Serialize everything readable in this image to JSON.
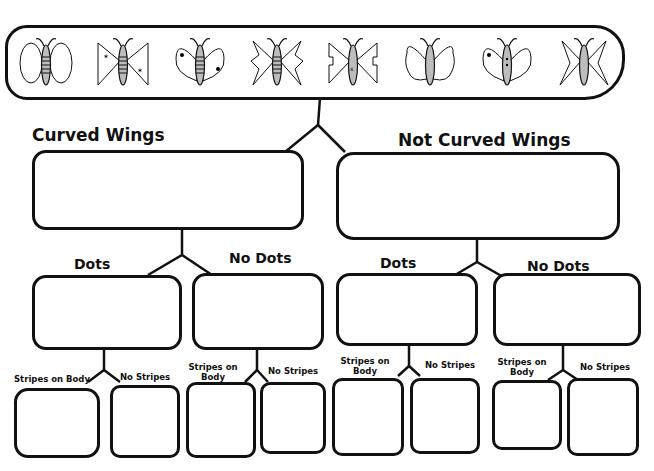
{
  "title": "",
  "levels": {
    "root": {
      "label": "",
      "butterflies": [
        "oval-stripes",
        "triangle-star",
        "curved-dot",
        "jagged-stripes",
        "notched-x",
        "ruffle-plain",
        "curved-dot-body",
        "pointed-plain"
      ]
    },
    "curved": {
      "label": "Curved Wings",
      "butterflies": [
        "curved-dot-body",
        "oval-stripes",
        "ruffle-plain",
        "curved-dot"
      ]
    },
    "not_curved": {
      "label": "Not Curved Wings",
      "butterflies": [
        "triangle-star",
        "pointed-plain",
        "jagged-stripes",
        "notched-x"
      ]
    },
    "curved_dots": {
      "label": "Dots",
      "butterflies": [
        "curved-dot-body",
        "curved-dot"
      ]
    },
    "curved_nodots": {
      "label": "No Dots",
      "butterflies": [
        "oval-stripes",
        "ruffle-plain"
      ]
    },
    "notcurved_dots": {
      "label": "Dots",
      "butterflies": [
        "notched-x",
        "jagged-stripes"
      ]
    },
    "notcurved_nodots": {
      "label": "No Dots",
      "butterflies": [
        "triangle-star",
        "pointed-plain"
      ]
    },
    "leaves": [
      {
        "label": "Stripes on Body",
        "butterfly": "curved-dot"
      },
      {
        "label": "No Stripes",
        "butterfly": "curved-dot-body"
      },
      {
        "label": "Stripes on Body",
        "butterfly": "oval-stripes"
      },
      {
        "label": "No Stripes",
        "butterfly": "ruffle-plain"
      },
      {
        "label": "Stripes on Body",
        "butterfly": "jagged-stripes"
      },
      {
        "label": "No Stripes",
        "butterfly": "notched-x"
      },
      {
        "label": "Stripes on Body",
        "butterfly": "triangle-star"
      },
      {
        "label": "No Stripes",
        "butterfly": "pointed-plain"
      }
    ]
  },
  "colors": {
    "ink": "#111111",
    "body_fill": "#bdbdbd",
    "paper": "#ffffff"
  }
}
